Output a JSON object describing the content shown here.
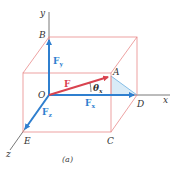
{
  "figure": {
    "caption": "(a)",
    "axes": {
      "x": "x",
      "y": "y",
      "z": "z"
    },
    "points": {
      "O": "O",
      "A": "A",
      "B": "B",
      "C": "C",
      "D": "D",
      "E": "E"
    },
    "vectors": {
      "F": {
        "label": "F",
        "color": "#d9434f"
      },
      "Fx": {
        "label": "F",
        "sub": "x",
        "color": "#2f7fcf"
      },
      "Fy": {
        "label": "F",
        "sub": "y",
        "color": "#2f7fcf"
      },
      "Fz": {
        "label": "F",
        "sub": "z",
        "color": "#2f7fcf"
      }
    },
    "angle": {
      "label": "θ",
      "sub": "x"
    },
    "colors": {
      "box": "#e88a8a",
      "axis": "#555555",
      "shade": "#cfe6f5"
    }
  }
}
